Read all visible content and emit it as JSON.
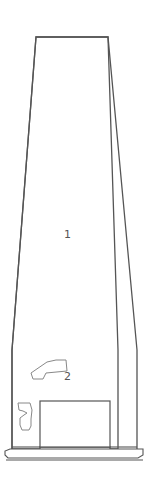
{
  "diagram": {
    "type": "tower-elevation-line-drawing",
    "stroke_color": "#555555",
    "fill_color": "#ffffff",
    "labels": [
      {
        "id": "part-1",
        "text": "1",
        "x": 64,
        "y": 229
      },
      {
        "id": "part-2",
        "text": "2",
        "x": 64,
        "y": 371
      }
    ],
    "parts": [
      {
        "id": "tower-body",
        "description": "tapered tower shaft"
      },
      {
        "id": "part-2-shape",
        "description": "irregular polygon stone / opening marked 2"
      },
      {
        "id": "part-3-shape",
        "description": "irregular shape marked 3 (numeral-like)"
      },
      {
        "id": "door-opening",
        "description": "rectangular doorway at base"
      },
      {
        "id": "plinth",
        "description": "stepped base platform"
      }
    ]
  }
}
